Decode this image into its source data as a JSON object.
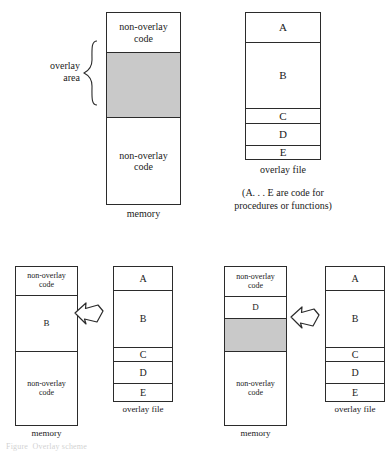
{
  "figure": {
    "title_note": "Overlay scheme diagram",
    "shaded_color": "#c9c9c9",
    "stroke_color": "#2b2b2b"
  },
  "panel_top_memory": {
    "caption": "memory",
    "brace_label": "overlay\narea",
    "segments": [
      {
        "id": "top-nonoverlay",
        "label": "non-overlay\ncode",
        "shaded": false
      },
      {
        "id": "overlay-area",
        "label": "",
        "shaded": true
      },
      {
        "id": "bot-nonoverlay",
        "label": "non-overlay\ncode",
        "shaded": false
      }
    ]
  },
  "panel_top_overlayfile": {
    "caption": "overlay file",
    "note": "(A. . . E are code for\nprocedures or functions)",
    "segments": [
      {
        "id": "a",
        "label": "A"
      },
      {
        "id": "b",
        "label": "B"
      },
      {
        "id": "c",
        "label": "C"
      },
      {
        "id": "d",
        "label": "D"
      },
      {
        "id": "e",
        "label": "E"
      }
    ]
  },
  "panel_bl_memory": {
    "caption": "memory",
    "segments": [
      {
        "id": "top-nonoverlay",
        "label": "non-overlay\ncode",
        "shaded": false
      },
      {
        "id": "loaded-b",
        "label": "B",
        "shaded": false
      },
      {
        "id": "bot-nonoverlay",
        "label": "non-overlay\ncode",
        "shaded": false
      }
    ]
  },
  "panel_bl_overlayfile": {
    "caption": "overlay file",
    "segments": [
      {
        "id": "a",
        "label": "A"
      },
      {
        "id": "b",
        "label": "B"
      },
      {
        "id": "c",
        "label": "C"
      },
      {
        "id": "d",
        "label": "D"
      },
      {
        "id": "e",
        "label": "E"
      }
    ]
  },
  "panel_br_memory": {
    "caption": "memory",
    "segments": [
      {
        "id": "top-nonoverlay",
        "label": "non-overlay\ncode",
        "shaded": false
      },
      {
        "id": "loaded-d",
        "label": "D",
        "shaded": false
      },
      {
        "id": "free-space",
        "label": "",
        "shaded": true
      },
      {
        "id": "bot-nonoverlay",
        "label": "non-overlay\ncode",
        "shaded": false
      }
    ]
  },
  "panel_br_overlayfile": {
    "caption": "overlay file",
    "segments": [
      {
        "id": "a",
        "label": "A"
      },
      {
        "id": "b",
        "label": "B"
      },
      {
        "id": "c",
        "label": "C"
      },
      {
        "id": "d",
        "label": "D"
      },
      {
        "id": "e",
        "label": "E"
      }
    ]
  },
  "arrows": {
    "left_arrow_name": "load-arrow-left",
    "right_arrow_name": "load-arrow-right"
  },
  "footer": {
    "clipped_caption": "Figure  Overlay scheme"
  }
}
